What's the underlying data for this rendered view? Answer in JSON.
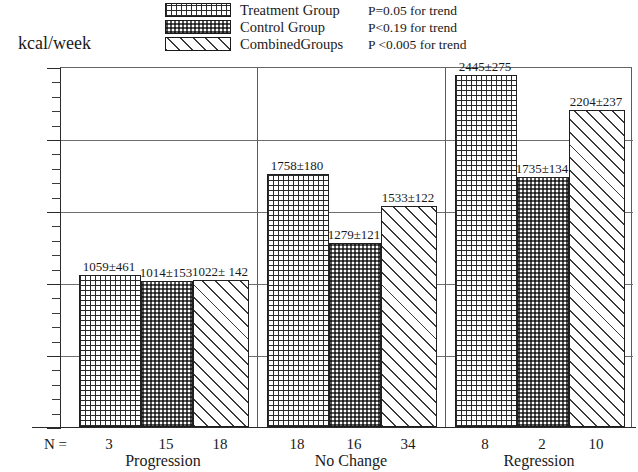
{
  "axis_title": "kcal/week",
  "n_prefix": "N =",
  "legend": {
    "items": [
      {
        "label": "Treatment Group",
        "pattern": "grid",
        "p": "P=0.05 for trend"
      },
      {
        "label": "Control Group",
        "pattern": "dots",
        "p": "P<0.19 for trend"
      },
      {
        "label": "CombinedGroups",
        "pattern": "diag",
        "p": "P <0.005 for trend"
      }
    ]
  },
  "chart_data": {
    "type": "bar",
    "title": "",
    "xlabel": "",
    "ylabel": "kcal/week",
    "ylim": [
      0,
      2500
    ],
    "ytick_major": [
      0,
      500,
      1000,
      1500,
      2000,
      2500
    ],
    "ytick_minor_step": 100,
    "grid": true,
    "legend_position": "top-center",
    "categories": [
      "Progression",
      "No Change",
      "Regression"
    ],
    "series": [
      {
        "name": "Treatment Group",
        "values": [
          1059,
          1758,
          2445
        ],
        "errors": [
          461,
          180,
          275
        ],
        "n": [
          3,
          18,
          8
        ]
      },
      {
        "name": "Control Group",
        "values": [
          1014,
          1279,
          1735
        ],
        "errors": [
          153,
          121,
          134
        ],
        "n": [
          15,
          16,
          2
        ]
      },
      {
        "name": "CombinedGroups",
        "values": [
          1022,
          1533,
          2204
        ],
        "errors": [
          142,
          122,
          237
        ],
        "n": [
          18,
          34,
          10
        ]
      }
    ],
    "annotations": {
      "bar_labels": [
        [
          "1059±461",
          "1014±153",
          "1022± 142"
        ],
        [
          "1758±180",
          "1279±121",
          "1533±122"
        ],
        [
          "2445±275",
          "1735±134",
          "2204±237"
        ]
      ],
      "n_labels": [
        [
          "3",
          "15",
          "18"
        ],
        [
          "18",
          "16",
          "34"
        ],
        [
          "8",
          "2",
          "10"
        ]
      ],
      "trend_tests": [
        "P=0.05 for trend",
        "P<0.19 for trend",
        "P <0.005 for trend"
      ]
    }
  }
}
